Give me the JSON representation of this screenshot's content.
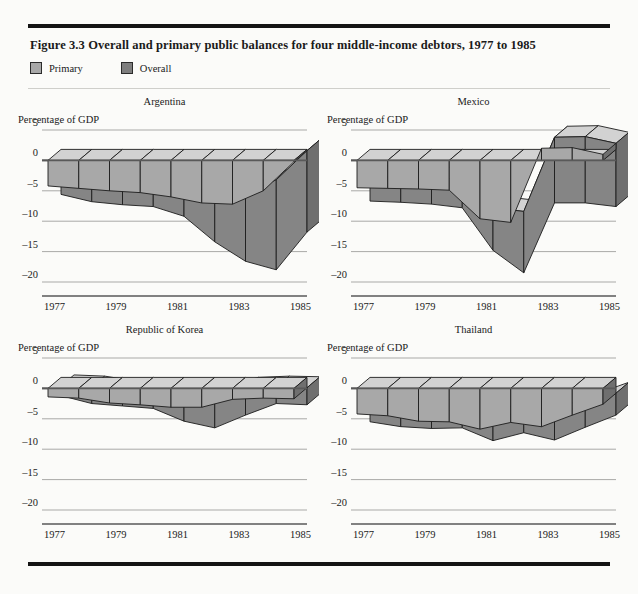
{
  "figure": {
    "title": "Figure 3.3  Overall and primary public balances for four middle-income debtors, 1977 to 1985",
    "legend": [
      {
        "label": "Primary",
        "color": "#a8a8a8",
        "name": "primary"
      },
      {
        "label": "Overall",
        "color": "#7e7e7e",
        "name": "overall"
      }
    ]
  },
  "axis": {
    "caption": "Percentage of GDP",
    "y_ticks": [
      "5",
      "0",
      "–5",
      "–10",
      "–15",
      "–20"
    ],
    "y_values": [
      5,
      0,
      -5,
      -10,
      -15,
      -20
    ],
    "x_ticks": [
      "1977",
      "1979",
      "1981",
      "1983",
      "1985"
    ],
    "x_tick_values": [
      1977,
      1979,
      1981,
      1983,
      1985
    ]
  },
  "colors": {
    "primary_top": "#a8a8a8",
    "primary_side": "#bdbdbd",
    "overall_top": "#858585",
    "overall_side": "#9a9a9a",
    "highlight": "#d2d2d2",
    "cap_dark": "#6f6f6f",
    "outline": "#1c1c1c"
  },
  "chart_data": [
    {
      "type": "area",
      "title": "Argentina",
      "xlabel": "",
      "ylabel": "Percentage of GDP",
      "ylim": [
        -20,
        5
      ],
      "grid": true,
      "legend_position": "top-left",
      "x": [
        1977,
        1978,
        1979,
        1980,
        1981,
        1982,
        1983,
        1984,
        1985
      ],
      "series": [
        {
          "name": "Primary",
          "values": [
            -4.2,
            -4.6,
            -5.0,
            -5.3,
            -6.0,
            -7.0,
            -7.2,
            -5.0,
            -0.2
          ]
        },
        {
          "name": "Overall",
          "values": [
            -7.4,
            -8.6,
            -9.1,
            -9.4,
            -11.0,
            -15.2,
            -18.4,
            -19.8,
            -13.6
          ]
        }
      ]
    },
    {
      "type": "area",
      "title": "Mexico",
      "xlabel": "",
      "ylabel": "Percentage of GDP",
      "ylim": [
        -20,
        5
      ],
      "grid": true,
      "legend_position": "top-left",
      "x": [
        1977,
        1978,
        1979,
        1980,
        1981,
        1982,
        1983,
        1984,
        1985
      ],
      "series": [
        {
          "name": "Primary",
          "values": [
            -4.5,
            -4.6,
            -4.7,
            -4.9,
            -9.6,
            -10.2,
            2.0,
            2.1,
            1.0
          ]
        },
        {
          "name": "Overall",
          "values": [
            -8.5,
            -8.7,
            -9.0,
            -9.6,
            -16.6,
            -20.3,
            -8.8,
            -8.8,
            -9.4
          ]
        }
      ]
    },
    {
      "type": "area",
      "title": "Republic of Korea",
      "xlabel": "",
      "ylabel": "Percentage of GDP",
      "ylim": [
        -20,
        5
      ],
      "grid": true,
      "legend_position": "top-left",
      "x": [
        1977,
        1978,
        1979,
        1980,
        1981,
        1982,
        1983,
        1984,
        1985
      ],
      "series": [
        {
          "name": "Primary",
          "values": [
            -1.4,
            -1.6,
            -2.4,
            -2.7,
            -3.1,
            -3.1,
            -1.8,
            -1.6,
            -1.7
          ]
        },
        {
          "name": "Overall",
          "values": [
            -3.0,
            -4.3,
            -4.7,
            -5.1,
            -7.2,
            -8.3,
            -6.2,
            -4.3,
            -4.5
          ]
        }
      ]
    },
    {
      "type": "area",
      "title": "Thailand",
      "xlabel": "",
      "ylabel": "Percentage of GDP",
      "ylim": [
        -20,
        5
      ],
      "grid": true,
      "legend_position": "top-left",
      "x": [
        1977,
        1978,
        1979,
        1980,
        1981,
        1982,
        1983,
        1984,
        1985
      ],
      "series": [
        {
          "name": "Primary",
          "values": [
            -4.2,
            -4.5,
            -5.4,
            -5.5,
            -6.7,
            -5.6,
            -6.3,
            -4.4,
            -2.6
          ]
        },
        {
          "name": "Overall",
          "values": [
            -7.3,
            -8.1,
            -8.4,
            -8.3,
            -10.4,
            -9.1,
            -10.3,
            -8.2,
            -6.2
          ]
        }
      ]
    }
  ]
}
